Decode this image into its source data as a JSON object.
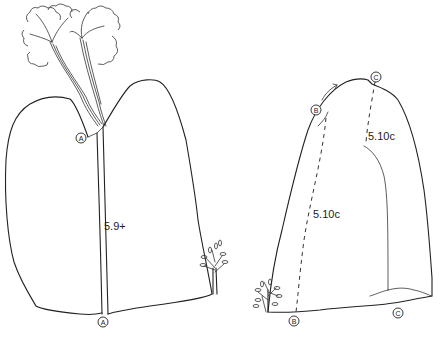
{
  "topo": {
    "left_boulder": {
      "routes": [
        {
          "id": "A",
          "grade": "5.9+",
          "start_marker": "A",
          "top_marker": "A",
          "style": "crack"
        }
      ]
    },
    "right_boulder": {
      "routes": [
        {
          "id": "B",
          "grade": "5.10c",
          "start_marker": "B",
          "top_marker": "B",
          "style": "dashed"
        },
        {
          "id": "C",
          "grade": "5.10c",
          "start_marker": "C",
          "top_marker": "C",
          "style": "dashed"
        }
      ]
    },
    "markers": {
      "a_top": "A",
      "a_bottom": "A",
      "b_top": "B",
      "b_bottom": "B",
      "c_top": "C",
      "c_bottom": "C"
    },
    "colors": {
      "line": "#222222",
      "background": "#ffffff"
    }
  }
}
